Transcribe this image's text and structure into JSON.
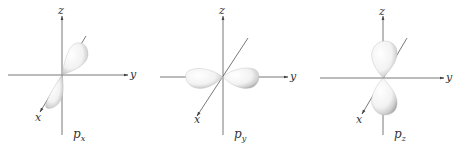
{
  "diagram": {
    "panels": [
      {
        "id": "px",
        "axis_labels": {
          "z": "z",
          "y": "y",
          "x": "x"
        },
        "orbital_label": {
          "main": "p",
          "sub": "x"
        },
        "lobe_orientation": "along x-axis (diagonal)"
      },
      {
        "id": "py",
        "axis_labels": {
          "z": "z",
          "y": "y",
          "x": "x"
        },
        "orbital_label": {
          "main": "p",
          "sub": "y"
        },
        "lobe_orientation": "along y-axis (horizontal)"
      },
      {
        "id": "pz",
        "axis_labels": {
          "z": "z",
          "y": "y",
          "x": "x"
        },
        "orbital_label": {
          "main": "p",
          "sub": "z"
        },
        "lobe_orientation": "along z-axis (vertical)"
      }
    ],
    "colors": {
      "axis": "#555555",
      "lobe_fill": "#f4f4f4",
      "lobe_shade": "#b8b8b8",
      "text": "#333333"
    }
  }
}
